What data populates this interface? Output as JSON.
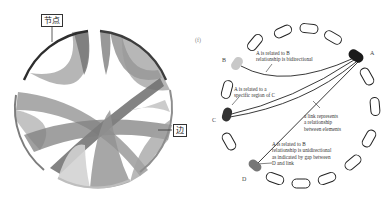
{
  "left_diagram": {
    "type": "chord-diagram",
    "callouts": {
      "node_label": "节点",
      "edge_label": "边"
    }
  },
  "right_diagram": {
    "panel_tag": "(f)",
    "nodes": {
      "a": "A",
      "b": "B",
      "c": "C",
      "d": "D"
    },
    "annotations": {
      "ab": [
        "A is related to B",
        "relationship is bidirectional"
      ],
      "ac": [
        "A is related to a",
        "specific region of C"
      ],
      "link": [
        "a link represents",
        "a relationship",
        "between elements"
      ],
      "ad": [
        "A is related to B",
        "relationship is unidirectional",
        "as indicated by gap between",
        "D and link"
      ]
    },
    "colors": {
      "a": "#1a1a1a",
      "b": "#c8c8c8",
      "c": "#333333",
      "d": "#777777"
    }
  }
}
